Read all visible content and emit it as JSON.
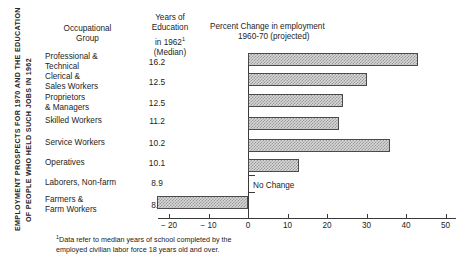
{
  "side_title": {
    "line1": "EMPLOYMENT PROSPECTS FOR 1970 AND THE EDUCATION",
    "line2": "OF PEOPLE WHO HELD SUCH JOBS IN 1962"
  },
  "headers": {
    "occupational_group": "Occupational\nGroup",
    "occupational_group_l1": "Occupational",
    "occupational_group_l2": "Group",
    "education_l1": "Years of",
    "education_l2": "Education",
    "education_l3": "in 1962",
    "education_sup": "1",
    "education_l4": "(Median)",
    "percent_l1": "Percent Change in employment",
    "percent_l2": "1960-70 (projected)"
  },
  "no_change_label": "No Change",
  "footnote": {
    "sup": "1",
    "line1": "Data refer to median years of school completed by the",
    "line2": "employed civilian labor force 18 years old and over."
  },
  "axis": {
    "ticks": [
      "− 20",
      "− 10",
      "0",
      "10",
      "20",
      "30",
      "40",
      "50"
    ],
    "tick_values": [
      -20,
      -10,
      0,
      10,
      20,
      30,
      40,
      50
    ]
  },
  "chart_data": {
    "type": "bar",
    "orientation": "horizontal",
    "title": "EMPLOYMENT PROSPECTS FOR 1970 AND THE EDUCATION OF PEOPLE WHO HELD SUCH JOBS IN 1962",
    "xlabel": "Percent Change in employment 1960-70 (projected)",
    "ylabel": "Occupational Group",
    "xlim": [
      -25,
      52
    ],
    "grid": false,
    "legend": null,
    "categories": [
      "Professional & Technical",
      "Clerical & Sales Workers",
      "Proprietors & Managers",
      "Skilled Workers",
      "Service Workers",
      "Operatives",
      "Laborers, Non-farm",
      "Farmers & Farm Workers"
    ],
    "values": [
      43,
      30,
      24,
      23,
      36,
      13,
      0,
      -23
    ],
    "series": [
      {
        "name": "Percent Change in employment 1960-70 (projected)",
        "values": [
          43,
          30,
          24,
          23,
          36,
          13,
          0,
          -23
        ]
      },
      {
        "name": "Years of Education in 1962 (Median)",
        "values": [
          16.2,
          12.5,
          12.5,
          11.2,
          10.2,
          10.1,
          8.9,
          8.7
        ]
      }
    ],
    "annotations": [
      {
        "category": "Laborers, Non-farm",
        "text": "No Change",
        "value": 0
      }
    ]
  },
  "rows": [
    {
      "group_l1": "Professional &",
      "group_l2": "Technical",
      "education": "16.2",
      "percent": 43,
      "top": 52,
      "two_line": true
    },
    {
      "group_l1": "Clerical &",
      "group_l2": "Sales Workers",
      "education": "12.5",
      "percent": 30,
      "top": 72,
      "two_line": true
    },
    {
      "group_l1": "Proprietors",
      "group_l2": "& Managers",
      "education": "12.5",
      "percent": 24,
      "top": 93,
      "two_line": true
    },
    {
      "group_l1": "Skilled Workers",
      "group_l2": "",
      "education": "11.2",
      "percent": 23,
      "top": 116,
      "two_line": false
    },
    {
      "group_l1": "Service Workers",
      "group_l2": "",
      "education": "10.2",
      "percent": 36,
      "top": 138,
      "two_line": false
    },
    {
      "group_l1": "Operatives",
      "group_l2": "",
      "education": "10.1",
      "percent": 13,
      "top": 158,
      "two_line": false
    },
    {
      "group_l1": "Laborers, Non-farm",
      "group_l2": "",
      "education": "8.9",
      "percent": 0,
      "top": 178,
      "two_line": false
    },
    {
      "group_l1": "Farmers &",
      "group_l2": "Farm Workers",
      "education": "8.7",
      "percent": -23,
      "top": 195,
      "two_line": true
    }
  ]
}
